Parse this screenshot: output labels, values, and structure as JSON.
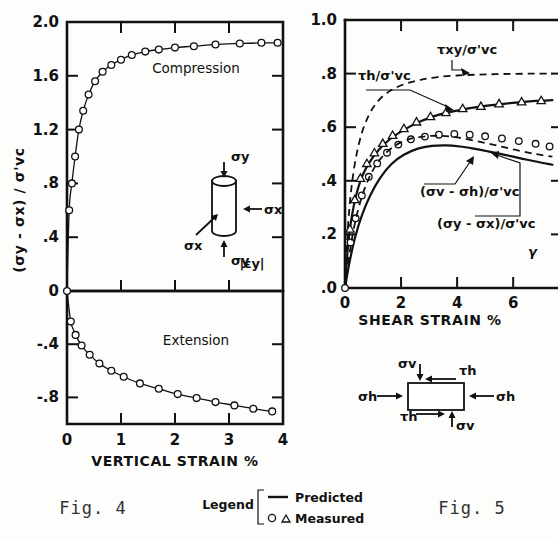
{
  "figure": {
    "fig4_caption": "Fig. 4",
    "fig5_caption": "Fig. 5"
  },
  "legend": {
    "title": "Legend",
    "predicted_label": "Predicted",
    "measured_label": "Measured",
    "circle_symbol": "o",
    "triangle_symbol": "△",
    "line_symbol": "—"
  },
  "fig4": {
    "ylabel": "(σy - σx) / σ'vc",
    "xlabel": "VERTICAL  STRAIN   %",
    "annotation_top": "Compression",
    "annotation_bottom": "Extension",
    "strain_symbol": "|εy|",
    "inset": {
      "sigma_y_top": "σy",
      "sigma_y_bottom": "σy",
      "sigma_x_right": "σx",
      "sigma_x_left": "σx"
    },
    "ytick_labels_top": [
      "2.0",
      "1.6",
      "1.2",
      ".8",
      ".4",
      "0"
    ],
    "ytick_values_top": [
      2.0,
      1.6,
      1.2,
      0.8,
      0.4,
      0.0
    ],
    "ytick_labels_bottom": [
      "0",
      "-.4",
      "-.8"
    ],
    "ytick_values_bottom": [
      0.0,
      -0.4,
      -0.8
    ],
    "xtick_labels": [
      "0",
      "1",
      "2",
      "3",
      "4"
    ],
    "xtick_values": [
      0,
      1,
      2,
      3,
      4
    ]
  },
  "fig5": {
    "xlabel": "SHEAR  STRAIN   %",
    "gamma_symbol": "γ",
    "ytick_labels": [
      "1.0",
      ".8",
      ".6",
      ".4",
      ".2",
      ".0"
    ],
    "ytick_values": [
      1.0,
      0.8,
      0.6,
      0.4,
      0.2,
      0.0
    ],
    "xtick_labels": [
      "0",
      "2",
      "4",
      "6"
    ],
    "xtick_values": [
      0,
      2,
      4,
      6
    ],
    "curve_labels": {
      "tau_xy": "τxy/σ'vc",
      "tau_h": "τh/σ'vc",
      "sv_sh": "(σv - σh)/σ'vc",
      "sy_sx": "(σy - σx)/σ'vc"
    },
    "inset": {
      "sigma_v_top": "σv",
      "sigma_v_bottom": "σv",
      "tau_h_top": "τh",
      "tau_h_bottom": "τh",
      "sigma_h_left": "σh",
      "sigma_h_right": "σh"
    }
  },
  "chart_data": [
    {
      "type": "line",
      "id": "fig4-compression",
      "title": "Compression",
      "xlabel": "VERTICAL STRAIN %",
      "ylabel": "(σy - σx) / σ'vc",
      "xlim": [
        0,
        4
      ],
      "ylim": [
        0,
        2.0
      ],
      "grid": false,
      "series": [
        {
          "name": "Predicted (compression)",
          "style": "line-with-open-circles",
          "x": [
            0.0,
            0.04,
            0.09,
            0.15,
            0.22,
            0.3,
            0.4,
            0.52,
            0.66,
            0.82,
            1.0,
            1.2,
            1.45,
            1.7,
            2.0,
            2.35,
            2.75,
            3.2,
            3.6,
            3.9
          ],
          "y": [
            0.0,
            0.6,
            0.8,
            1.0,
            1.2,
            1.34,
            1.46,
            1.56,
            1.63,
            1.68,
            1.72,
            1.755,
            1.78,
            1.795,
            1.81,
            1.82,
            1.833,
            1.84,
            1.845,
            1.845
          ]
        }
      ]
    },
    {
      "type": "line",
      "id": "fig4-extension",
      "title": "Extension",
      "xlabel": "VERTICAL STRAIN %",
      "ylabel": "(σy - σx) / σ'vc",
      "xlim": [
        0,
        4
      ],
      "ylim": [
        -1.0,
        0
      ],
      "grid": false,
      "series": [
        {
          "name": "Predicted (extension)",
          "style": "line-with-open-circles",
          "x": [
            0.0,
            0.07,
            0.16,
            0.27,
            0.42,
            0.6,
            0.82,
            1.05,
            1.35,
            1.7,
            2.05,
            2.4,
            2.75,
            3.1,
            3.45,
            3.8
          ],
          "y": [
            0.0,
            -0.23,
            -0.33,
            -0.41,
            -0.48,
            -0.545,
            -0.6,
            -0.645,
            -0.695,
            -0.735,
            -0.775,
            -0.805,
            -0.835,
            -0.86,
            -0.885,
            -0.905
          ]
        }
      ]
    },
    {
      "type": "line",
      "id": "fig5",
      "title": "",
      "xlabel": "SHEAR STRAIN %",
      "ylabel": "",
      "xlim": [
        0,
        7.6
      ],
      "ylim": [
        0,
        1.0
      ],
      "grid": false,
      "series": [
        {
          "name": "τh/σ'vc predicted",
          "style": "solid",
          "x": [
            0.0,
            0.12,
            0.3,
            0.55,
            0.85,
            1.2,
            1.6,
            2.1,
            2.7,
            3.3,
            4.0,
            4.7,
            5.4,
            6.1,
            6.8,
            7.4
          ],
          "y": [
            0.0,
            0.17,
            0.3,
            0.4,
            0.465,
            0.515,
            0.555,
            0.59,
            0.622,
            0.645,
            0.662,
            0.675,
            0.684,
            0.692,
            0.698,
            0.701
          ]
        },
        {
          "name": "τh/σ'vc measured (triangles)",
          "style": "triangles",
          "x": [
            0.18,
            0.35,
            0.55,
            0.78,
            1.05,
            1.35,
            1.7,
            2.1,
            2.55,
            3.05,
            3.6,
            4.2,
            4.85,
            5.5,
            6.3,
            7.0
          ],
          "y": [
            0.22,
            0.33,
            0.41,
            0.465,
            0.505,
            0.54,
            0.57,
            0.595,
            0.62,
            0.64,
            0.655,
            0.67,
            0.678,
            0.688,
            0.695,
            0.7
          ]
        },
        {
          "name": "τxy/σ'vc predicted (dashed)",
          "style": "dashed",
          "x": [
            0.0,
            0.12,
            0.3,
            0.55,
            0.85,
            1.2,
            1.6,
            2.1,
            2.7,
            3.3,
            4.0,
            4.7,
            5.4,
            6.1,
            6.8,
            7.4
          ],
          "y": [
            0.0,
            0.25,
            0.43,
            0.56,
            0.645,
            0.7,
            0.735,
            0.76,
            0.777,
            0.787,
            0.793,
            0.796,
            0.798,
            0.799,
            0.8,
            0.8
          ]
        },
        {
          "name": "(σv - σh)/σ'vc predicted",
          "style": "solid",
          "x": [
            0.0,
            0.15,
            0.35,
            0.6,
            0.9,
            1.25,
            1.65,
            2.1,
            2.6,
            3.1,
            3.6,
            4.1,
            4.6,
            5.1,
            5.7,
            6.3,
            6.9,
            7.4
          ],
          "y": [
            0.0,
            0.09,
            0.185,
            0.27,
            0.345,
            0.41,
            0.462,
            0.497,
            0.52,
            0.53,
            0.532,
            0.528,
            0.52,
            0.51,
            0.497,
            0.483,
            0.47,
            0.46
          ]
        },
        {
          "name": "(σy - σx)/σ'vc measured (circles)",
          "style": "circles",
          "x": [
            0.2,
            0.38,
            0.6,
            0.85,
            1.15,
            1.5,
            1.9,
            2.35,
            2.85,
            3.35,
            3.9,
            4.45,
            5.0,
            5.6,
            6.2,
            6.8,
            7.3
          ],
          "y": [
            0.17,
            0.26,
            0.345,
            0.415,
            0.465,
            0.505,
            0.535,
            0.555,
            0.565,
            0.572,
            0.575,
            0.572,
            0.566,
            0.558,
            0.548,
            0.538,
            0.528
          ]
        },
        {
          "name": "(σv - σh)/σ'vc predicted (dashed lower)",
          "style": "dashed",
          "x": [
            0.0,
            0.15,
            0.35,
            0.6,
            0.9,
            1.25,
            1.7,
            2.2,
            2.8,
            3.4,
            4.0,
            4.7,
            5.4,
            6.1,
            6.8,
            7.4
          ],
          "y": [
            0.0,
            0.12,
            0.24,
            0.34,
            0.42,
            0.48,
            0.525,
            0.552,
            0.565,
            0.568,
            0.562,
            0.548,
            0.532,
            0.515,
            0.5,
            0.49
          ]
        }
      ]
    }
  ]
}
